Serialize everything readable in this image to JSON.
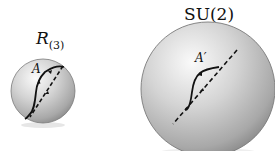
{
  "figure": {
    "left": {
      "group_label": "R",
      "group_subscript": "(3)",
      "point_label": "A",
      "sphere": {
        "cx": 43,
        "cy": 91,
        "r": 32
      }
    },
    "right": {
      "group_label": "SU(2)",
      "point_label": "A′",
      "sphere": {
        "cx": 208,
        "cy": 89,
        "r": 67
      }
    },
    "colors": {
      "sphere_light": "#f4f4f4",
      "sphere_mid": "#c8c8c8",
      "sphere_dark": "#8a8a8a",
      "ink": "#111111"
    }
  }
}
